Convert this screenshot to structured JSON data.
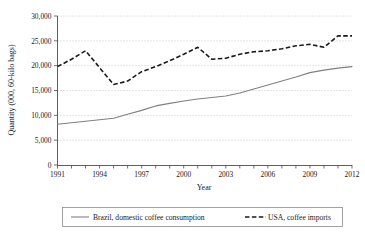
{
  "chart_data": {
    "type": "line",
    "title": "",
    "xlabel": "Year",
    "ylabel": "Quantity (000, 60-kilo bags)",
    "xlim": [
      1991,
      2012
    ],
    "ylim": [
      0,
      30000
    ],
    "grid": true,
    "legend_position": "bottom",
    "x": [
      1991,
      1992,
      1993,
      1994,
      1995,
      1996,
      1997,
      1998,
      1999,
      2000,
      2001,
      2002,
      2003,
      2004,
      2005,
      2006,
      2007,
      2008,
      2009,
      2010,
      2011,
      2012
    ],
    "xticks": [
      1991,
      1994,
      1997,
      2000,
      2003,
      2006,
      2009,
      2012
    ],
    "xtick_labels": [
      "1991",
      "1994",
      "1997",
      "2000",
      "2003",
      "2006",
      "2009",
      "2012"
    ],
    "yticks": [
      0,
      5000,
      10000,
      15000,
      20000,
      25000,
      30000
    ],
    "ytick_labels": [
      "0",
      "5,000",
      "10,000",
      "15,000",
      "20,000",
      "25,000",
      "30,000"
    ],
    "series": [
      {
        "name": "Brazil, domestic coffee consumption",
        "style": "solid",
        "color": "#808080",
        "values": [
          8200,
          8500,
          8800,
          9100,
          9400,
          10200,
          11000,
          11900,
          12400,
          12900,
          13300,
          13600,
          13900,
          14500,
          15300,
          16100,
          16900,
          17700,
          18600,
          19100,
          19500,
          19800
        ]
      },
      {
        "name": "USA, coffee imports",
        "style": "dashed",
        "color": "#1a1a1a",
        "values": [
          19800,
          21300,
          23000,
          19600,
          16200,
          16900,
          18800,
          19800,
          21000,
          22300,
          23700,
          21300,
          21500,
          22300,
          22800,
          23000,
          23400,
          24000,
          24300,
          23700,
          26000,
          26000
        ]
      }
    ]
  },
  "legend": {
    "items": [
      {
        "label": "Brazil, domestic coffee consumption"
      },
      {
        "label": "USA, coffee imports"
      }
    ]
  }
}
